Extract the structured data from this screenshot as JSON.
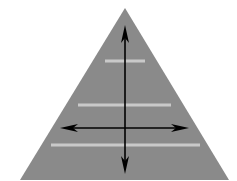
{
  "diagram": {
    "type": "pyramid-with-axes",
    "background": "#ffffff",
    "triangle": {
      "apex": [
        125,
        8
      ],
      "base_left": [
        20,
        180
      ],
      "base_right": [
        229,
        180
      ],
      "fill": "#8a8a8a"
    },
    "stripes": [
      {
        "x1": 105,
        "x2": 145,
        "y": 61,
        "color": "#c9c9c9"
      },
      {
        "x1": 78,
        "x2": 171,
        "y": 105,
        "color": "#c9c9c9"
      },
      {
        "x1": 51,
        "x2": 200,
        "y": 145,
        "color": "#c9c9c9"
      }
    ],
    "vertical_arrow": {
      "x": 125,
      "y1": 25,
      "y2": 174,
      "color": "#000000",
      "double_headed": true
    },
    "horizontal_arrow": {
      "y": 128,
      "x1": 60,
      "x2": 189,
      "color": "#000000",
      "double_headed": true
    }
  }
}
